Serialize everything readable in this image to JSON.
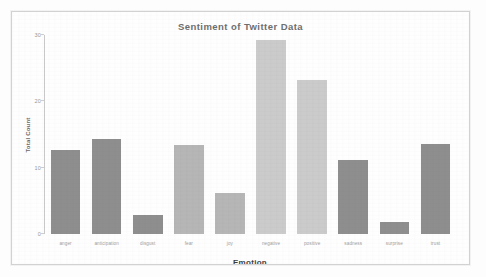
{
  "chart_data": {
    "type": "bar",
    "title": "Sentiment of Twitter Data",
    "xlabel": "Emotion",
    "ylabel": "Total Count",
    "categories": [
      "anger",
      "anticipation",
      "disgust",
      "fear",
      "joy",
      "negative",
      "positive",
      "sadness",
      "surprise",
      "trust"
    ],
    "values": [
      12.7,
      14.3,
      2.8,
      13.4,
      6.2,
      29.2,
      23.2,
      11.2,
      1.8,
      13.6
    ],
    "ylim": [
      0,
      30
    ],
    "yticks": [
      0,
      10,
      20,
      30
    ],
    "ytick_labels": [
      "0",
      "10",
      "20",
      "30"
    ],
    "grid": false,
    "legend": false,
    "bar_colors": [
      "#8e8e8e",
      "#8e8e8e",
      "#8e8e8e",
      "#b6b6b6",
      "#b6b6b6",
      "#cbcbcb",
      "#cbcbcb",
      "#8e8e8e",
      "#8e8e8e",
      "#8e8e8e"
    ],
    "series": [
      {
        "name": "Total Count",
        "values": [
          12.7,
          14.3,
          2.8,
          13.4,
          6.2,
          29.2,
          23.2,
          11.2,
          1.8,
          13.6
        ]
      }
    ]
  },
  "figure": {
    "background": "#fdfdfd",
    "frame_border_color": "#d2d2d2",
    "axis_color": "#c9c9c9",
    "title_color": "#4f4f4f",
    "tick_label_color": "#9a9a9a"
  }
}
